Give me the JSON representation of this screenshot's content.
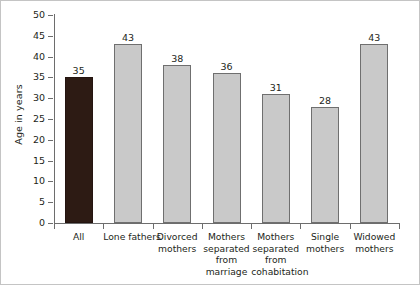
{
  "chart_data": {
    "type": "bar",
    "title": "",
    "subtitle": "",
    "xlabel": "",
    "ylabel": "Age in years",
    "ylim": [
      0,
      50
    ],
    "ytick_step": 5,
    "yticks": [
      0,
      5,
      10,
      15,
      20,
      25,
      30,
      35,
      40,
      45,
      50
    ],
    "grid": false,
    "legend": false,
    "categories": [
      "All",
      "Lone fathers",
      "Divorced mothers",
      "Mothers separated from marriage",
      "Mothers separated from cohabitation",
      "Single mothers",
      "Widowed mothers"
    ],
    "category_lines": [
      [
        "All"
      ],
      [
        "Lone fathers"
      ],
      [
        "Divorced",
        "mothers"
      ],
      [
        "Mothers",
        "separated",
        "from",
        "marriage"
      ],
      [
        "Mothers",
        "separated",
        "from",
        "cohabitation"
      ],
      [
        "Single",
        "mothers"
      ],
      [
        "Widowed",
        "mothers"
      ]
    ],
    "values": [
      35,
      43,
      38,
      36,
      31,
      28,
      43
    ],
    "data_labels": [
      "35",
      "43",
      "38",
      "36",
      "31",
      "28",
      "43"
    ],
    "bar_styles": [
      "dark",
      "gray",
      "gray",
      "gray",
      "gray",
      "gray",
      "gray"
    ],
    "colors": {
      "bar_dark": "#2d1b14",
      "bar_gray": "#c9c9c9",
      "bar_gray_border": "#6f6f6f",
      "axis": "#6d6d6d",
      "text": "#231f20",
      "frame": "#c4c4c4",
      "background": "#ffffff"
    }
  }
}
